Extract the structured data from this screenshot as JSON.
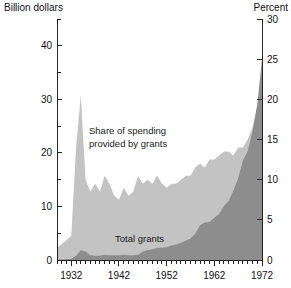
{
  "chart_data": {
    "type": "area",
    "title": "",
    "subtitle": "",
    "xlabel": "",
    "ylabel": "Billion dollars",
    "y2label": "Percent",
    "grid": false,
    "legend_position": "inline-annotations",
    "xlim": [
      1929,
      1972
    ],
    "ylim": [
      0,
      45
    ],
    "y2lim": [
      0,
      30
    ],
    "left_axis": {
      "label": "Billion dollars",
      "major_ticks": [
        0,
        10,
        20,
        30,
        40
      ],
      "major_tick_labels": [
        "0",
        "10",
        "20",
        "30",
        "40"
      ],
      "minor_ticks": [
        5,
        15,
        25,
        35,
        45
      ]
    },
    "right_axis": {
      "label": "Percent",
      "major_ticks": [
        0,
        5,
        10,
        15,
        20,
        25,
        30
      ],
      "major_tick_labels": [
        "0",
        "5",
        "10",
        "15",
        "20",
        "25",
        "30"
      ]
    },
    "x_axis": {
      "tick_interval_years": 1,
      "labeled_ticks": [
        1932,
        1942,
        1952,
        1962,
        1972
      ],
      "labeled_tick_labels": [
        "1932",
        "1942",
        "1952",
        "1962",
        "1972"
      ],
      "range_start": 1929,
      "range_end": 1972
    },
    "annotations": [
      {
        "name": "share-of-spending-label",
        "lines": [
          "Share of spending",
          "provided by grants"
        ],
        "line1": "Share of spending",
        "line2": "provided by grants"
      },
      {
        "name": "total-grants-label",
        "lines": [
          "Total grants"
        ],
        "line1": "Total grants"
      }
    ],
    "colors": {
      "share_area": "#c3c3c3",
      "grants_area": "#8d8d8d",
      "axis": "#222222",
      "text": "#111111",
      "background": "#ffffff"
    },
    "series": [
      {
        "name": "Share of spending provided by grants",
        "axis": "right",
        "unit": "percent",
        "x": [
          1929,
          1930,
          1931,
          1932,
          1933,
          1934,
          1935,
          1936,
          1937,
          1938,
          1939,
          1940,
          1941,
          1942,
          1943,
          1944,
          1945,
          1946,
          1947,
          1948,
          1949,
          1950,
          1951,
          1952,
          1953,
          1954,
          1955,
          1956,
          1957,
          1958,
          1959,
          1960,
          1961,
          1962,
          1963,
          1964,
          1965,
          1966,
          1967,
          1968,
          1969,
          1970,
          1971,
          1972
        ],
        "values": [
          1.5,
          2.0,
          2.5,
          3.0,
          14.0,
          20.5,
          10.0,
          8.5,
          9.5,
          8.5,
          10.5,
          9.5,
          8.0,
          7.5,
          9.0,
          8.0,
          8.5,
          10.5,
          9.5,
          10.0,
          9.5,
          10.5,
          9.5,
          9.0,
          9.5,
          9.5,
          10.0,
          10.5,
          10.5,
          11.5,
          12.0,
          11.5,
          12.5,
          12.5,
          13.0,
          13.5,
          13.5,
          13.0,
          14.0,
          14.0,
          15.0,
          16.5,
          19.0,
          23.5
        ]
      },
      {
        "name": "Total grants",
        "axis": "left",
        "unit": "billion dollars",
        "x": [
          1929,
          1930,
          1931,
          1932,
          1933,
          1934,
          1935,
          1936,
          1937,
          1938,
          1939,
          1940,
          1941,
          1942,
          1943,
          1944,
          1945,
          1946,
          1947,
          1948,
          1949,
          1950,
          1951,
          1952,
          1953,
          1954,
          1955,
          1956,
          1957,
          1958,
          1959,
          1960,
          1961,
          1962,
          1963,
          1964,
          1965,
          1966,
          1967,
          1968,
          1969,
          1970,
          1971,
          1972
        ],
        "values": [
          0.1,
          0.1,
          0.2,
          0.2,
          0.8,
          1.8,
          1.6,
          0.9,
          0.8,
          0.8,
          1.0,
          0.9,
          0.9,
          0.9,
          1.0,
          0.9,
          0.9,
          1.0,
          1.6,
          1.8,
          2.0,
          2.3,
          2.3,
          2.4,
          2.7,
          2.9,
          3.2,
          3.6,
          4.0,
          4.9,
          6.5,
          7.0,
          7.1,
          7.9,
          8.6,
          10.1,
          11.0,
          13.0,
          15.2,
          18.6,
          20.3,
          24.0,
          29.0,
          37.5
        ]
      }
    ]
  }
}
